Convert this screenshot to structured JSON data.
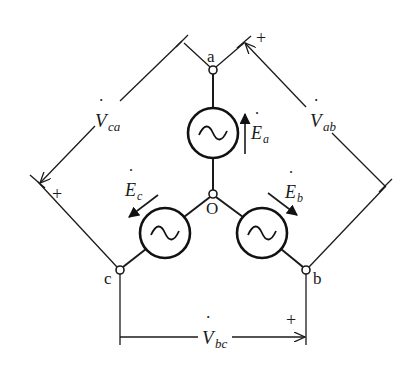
{
  "diagram": {
    "type": "three-phase Y-connected voltage source",
    "nodes": {
      "a": {
        "label": "a",
        "x": 213,
        "y": 70
      },
      "b": {
        "label": "b",
        "x": 306,
        "y": 270
      },
      "c": {
        "label": "c",
        "x": 120,
        "y": 270
      },
      "o": {
        "label": "O",
        "x": 213,
        "y": 194
      }
    },
    "sources": [
      {
        "id": "Ea",
        "label_main": "E",
        "label_sub": "a",
        "cx": 213,
        "cy": 133,
        "r": 25,
        "direction": "up"
      },
      {
        "id": "Eb",
        "label_main": "E",
        "label_sub": "b",
        "cx": 262,
        "cy": 233,
        "r": 25,
        "direction": "down-right"
      },
      {
        "id": "Ec",
        "label_main": "E",
        "label_sub": "c",
        "cx": 165,
        "cy": 233,
        "r": 25,
        "direction": "down-left"
      }
    ],
    "line_voltages": [
      {
        "id": "Vab",
        "label_main": "V",
        "label_sub": "ab",
        "plus": "+"
      },
      {
        "id": "Vbc",
        "label_main": "V",
        "label_sub": "bc",
        "plus": "+"
      },
      {
        "id": "Vca",
        "label_main": "V",
        "label_sub": "ca",
        "plus": "+"
      }
    ],
    "dot_glyph": "˙",
    "source_symbol": "ac-sine-source-icon"
  }
}
